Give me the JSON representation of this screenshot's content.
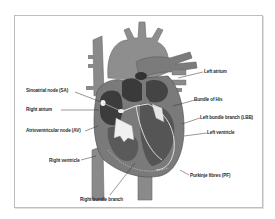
{
  "diagram": {
    "colors": {
      "vessel": "#8a8a8a",
      "vessel_dark": "#6e6e6e",
      "chamber": "#3c3c3c",
      "myocardium": "#7a7a7a",
      "conduction_path": "#e8e8e8",
      "valve": "#f2f2f2",
      "leader_line": "#333333",
      "frame_border": "#bdbdbd"
    },
    "labels": {
      "left_atrium": "Left atrium",
      "bundle_of_his": "Bundle of His",
      "sa_node": "Sinoatrial node (SA)",
      "left_bundle_branch": "Left bundle branch (LBB)",
      "right_atrium": "Right atrium",
      "av_node": "Atrioventricular node (AV)",
      "left_ventricle": "Left ventricle",
      "right_ventricle": "Right ventricle",
      "purkinje_fibres": "Purkinje fibres (PF)",
      "right_bundle_branch": "Right bundle branch"
    }
  }
}
